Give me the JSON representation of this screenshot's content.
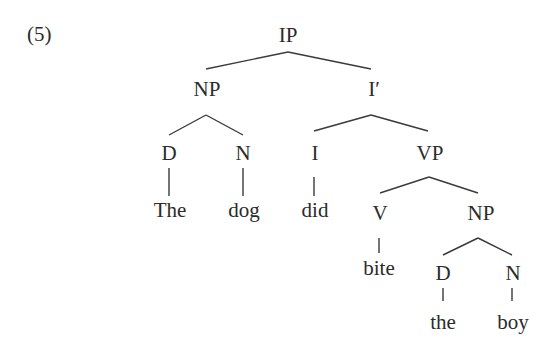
{
  "example_number": "(5)",
  "tree": {
    "nodes": {
      "IP": "IP",
      "NP1": "NP",
      "Ibar": "I′",
      "D1": "D",
      "N1": "N",
      "I": "I",
      "VP": "VP",
      "V": "V",
      "NP2": "NP",
      "D2": "D",
      "N2": "N"
    },
    "words": {
      "w1": "The",
      "w2": "dog",
      "w3": "did",
      "w4": "bite",
      "w5": "the",
      "w6": "boy"
    },
    "edges": [
      [
        "IP",
        "NP1"
      ],
      [
        "IP",
        "Ibar"
      ],
      [
        "NP1",
        "D1"
      ],
      [
        "NP1",
        "N1"
      ],
      [
        "Ibar",
        "I"
      ],
      [
        "Ibar",
        "VP"
      ],
      [
        "VP",
        "V"
      ],
      [
        "VP",
        "NP2"
      ],
      [
        "NP2",
        "D2"
      ],
      [
        "NP2",
        "N2"
      ],
      [
        "D1",
        "w1"
      ],
      [
        "N1",
        "w2"
      ],
      [
        "I",
        "w3"
      ],
      [
        "V",
        "w4"
      ],
      [
        "D2",
        "w5"
      ],
      [
        "N2",
        "w6"
      ]
    ],
    "sentence": "The dog did bite the boy"
  }
}
